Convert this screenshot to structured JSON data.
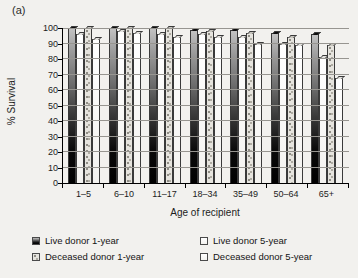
{
  "figure_label": "(a)",
  "chart_data": {
    "type": "bar",
    "title": "",
    "xlabel": "Age of recipient",
    "ylabel": "% Survival",
    "ylim": [
      0,
      100
    ],
    "ytick_step": 10,
    "grid": true,
    "legend_position": "bottom",
    "categories": [
      "1–5",
      "6–10",
      "11–17",
      "18–34",
      "35–49",
      "50–64",
      "65+"
    ],
    "series": [
      {
        "name": "Live donor 1-year",
        "style": "dark",
        "values": [
          100,
          100,
          100,
          99,
          99,
          97,
          96
        ]
      },
      {
        "name": "Live donor 5-year",
        "style": "white",
        "values": [
          96,
          98,
          96,
          96,
          94,
          90,
          81
        ]
      },
      {
        "name": "Deceased donor 1-year",
        "style": "speckled",
        "values": [
          100,
          100,
          100,
          98,
          97,
          94,
          89
        ]
      },
      {
        "name": "Deceased donor 5-year",
        "style": "white",
        "values": [
          93,
          97,
          94,
          94,
          90,
          89,
          68
        ]
      }
    ]
  },
  "colors": {
    "background": "#f2f1ee",
    "axis": "#000000",
    "grid": "#979590",
    "text": "#1c1c1c",
    "bar_dark_top": "#c2c2c2",
    "bar_dark_bottom": "#000000",
    "bar_white": "#fcfbf9",
    "bar_speckle_base": "#e6e4de",
    "bar_speckle_dot": "#8f8d85"
  }
}
